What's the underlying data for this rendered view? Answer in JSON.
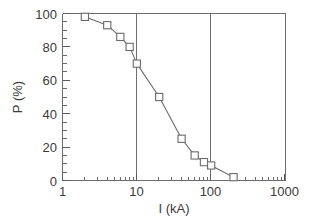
{
  "chart_data": {
    "type": "line",
    "title": "",
    "subtitle": "",
    "xlabel": "I (kA)",
    "ylabel": "P (%)",
    "xscale": "log",
    "yscale": "linear",
    "xlim": [
      1,
      1000
    ],
    "ylim": [
      0,
      100
    ],
    "grid": "vertical gridlines at x = 10 and x = 100",
    "legend": "none",
    "xticks": [
      1,
      10,
      100,
      1000
    ],
    "xtick_labels": [
      "1",
      "10",
      "100",
      "1000"
    ],
    "xminor_ticks": "log decade subdivisions 2-9 in each decade",
    "yticks": [
      0,
      20,
      40,
      60,
      80,
      100
    ],
    "ytick_labels": [
      "0",
      "20",
      "40",
      "60",
      "80",
      "100"
    ],
    "yminor_ticks": "every 5 units",
    "marker": "open square",
    "series": [
      {
        "name": "P(I)",
        "x": [
          2,
          4,
          6,
          8,
          10,
          20,
          40,
          60,
          80,
          100,
          200
        ],
        "values": [
          98,
          93,
          86,
          80,
          70,
          50,
          25,
          15,
          11,
          9,
          2
        ]
      }
    ],
    "annotations": []
  },
  "axes": {
    "y_label": "P (%)",
    "x_label": "I (kA)",
    "x_tick_labels": [
      "1",
      "10",
      "100",
      "1000"
    ],
    "y_tick_labels": [
      "100",
      "80",
      "60",
      "40",
      "20",
      "0"
    ]
  },
  "colors": {
    "background": "#ffffff",
    "frame": "#6e6e6e",
    "gridline": "#6e6e6e",
    "curve": "#6b6b6b",
    "marker_fill": "#ffffff",
    "marker_stroke": "#6b6b6b",
    "text": "#3a3a3a"
  }
}
